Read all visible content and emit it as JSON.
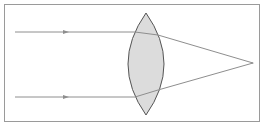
{
  "diagram": {
    "type": "converging-lens-ray-diagram",
    "colors": {
      "frame": "#9a9a9a",
      "ray": "#8e8e8e",
      "lens_fill": "#dcdcdc",
      "lens_stroke": "#555555",
      "background": "#ffffff"
    },
    "lens": {
      "shape": "biconvex",
      "center_x": 146,
      "top_y": 13,
      "bottom_y": 115,
      "half_width": 18
    },
    "rays": [
      {
        "id": "top-ray",
        "start": [
          15,
          32
        ],
        "arrow_x": 66,
        "lens_entry": [
          135,
          32
        ],
        "lens_exit": [
          158,
          35
        ],
        "focus": [
          253,
          63
        ]
      },
      {
        "id": "bottom-ray",
        "start": [
          15,
          97
        ],
        "arrow_x": 66,
        "lens_entry": [
          135,
          97
        ],
        "lens_exit": [
          158,
          90
        ],
        "focus": [
          253,
          63
        ]
      }
    ],
    "focal_point": [
      253,
      63
    ]
  }
}
